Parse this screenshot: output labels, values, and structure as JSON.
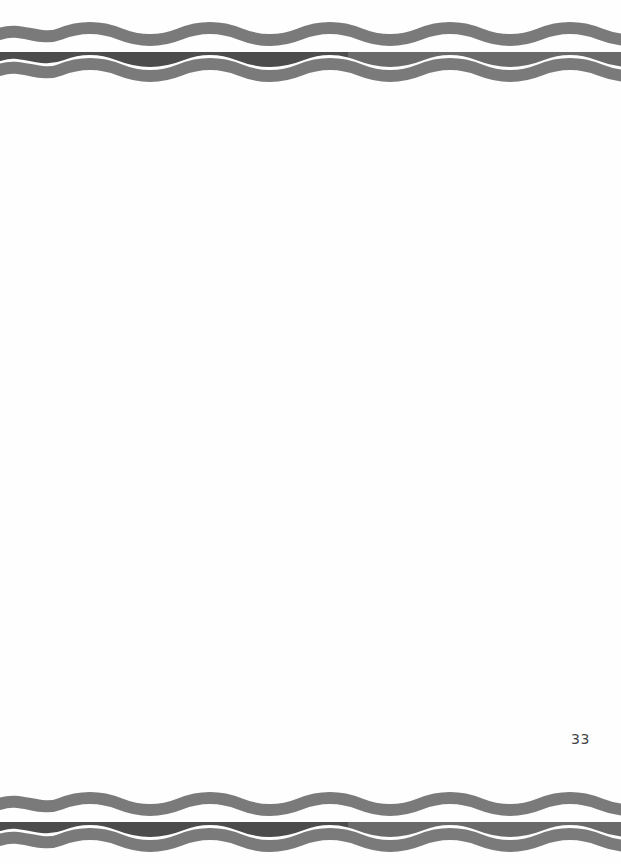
{
  "page": {
    "page_number": "33",
    "background": "#fefefe"
  },
  "borders": {
    "style": "wavy-ink-stripes",
    "outer_stripe_color": "#7a7a7a",
    "inner_stripe_color_left": "#4c4c4c",
    "inner_stripe_color_right": "#6a6a6a",
    "gap_color": "#f4f4f4"
  }
}
